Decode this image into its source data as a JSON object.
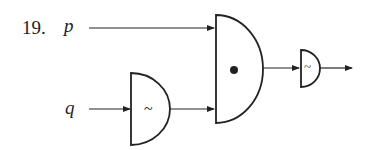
{
  "problem_number": "19.",
  "inputs": {
    "p": "p",
    "q": "q"
  },
  "gates": {
    "not_q": {
      "type": "NOT",
      "symbol": "~"
    },
    "and": {
      "type": "AND",
      "symbol": "•"
    },
    "not_out": {
      "type": "NOT",
      "symbol": "~"
    }
  },
  "colors": {
    "stroke": "#222222"
  }
}
